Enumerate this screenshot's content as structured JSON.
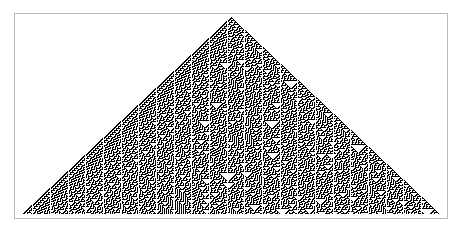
{
  "figure": {
    "kind": "cellular-automaton-evolution-diagram",
    "background_color": "#ffffff",
    "frame": {
      "border_color": "#b9b9b9",
      "border_width_px": 1,
      "fill_color": "#ffffff",
      "left_px": 14,
      "top_px": 13,
      "width_px": 434,
      "height_px": 206
    }
  },
  "automaton": {
    "name": "Rule 30",
    "rule_number": 30,
    "rule_binary": "00011110",
    "class": "elementary-cellular-automaton",
    "states": 2,
    "neighborhood": 3,
    "initial_condition": "single-black-cell",
    "boundary": "infinite-background-white",
    "alive_color": "#000000",
    "dead_color": "#ffffff",
    "rows": 197,
    "cell_width_px": 1.06,
    "cell_height_px": 1.0,
    "apex_x_px": 231,
    "apex_y_px": 17,
    "base_left_x_px": 22,
    "base_right_x_px": 440,
    "base_y_px": 214,
    "rule_table": [
      {
        "neighborhood": "111",
        "result": 0
      },
      {
        "neighborhood": "110",
        "result": 0
      },
      {
        "neighborhood": "101",
        "result": 0
      },
      {
        "neighborhood": "100",
        "result": 1
      },
      {
        "neighborhood": "011",
        "result": 1
      },
      {
        "neighborhood": "010",
        "result": 1
      },
      {
        "neighborhood": "001",
        "result": 1
      },
      {
        "neighborhood": "000",
        "result": 0
      }
    ]
  }
}
